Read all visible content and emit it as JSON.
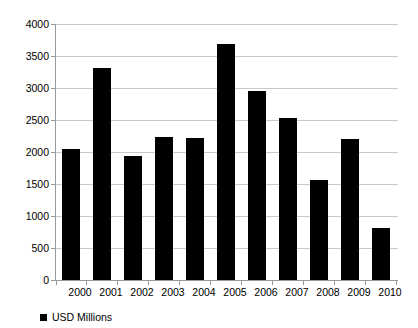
{
  "chart_data": {
    "type": "bar",
    "title": "",
    "subtitle": "",
    "xlabel": "",
    "ylabel": "",
    "categories": [
      "2000",
      "2001",
      "2002",
      "2003",
      "2004",
      "2005",
      "2006",
      "2007",
      "2008",
      "2009",
      "2010"
    ],
    "series": [
      {
        "name": "USD Millions",
        "color": "#000000",
        "values": [
          2050,
          3320,
          1940,
          2240,
          2220,
          3680,
          2950,
          2530,
          1560,
          2200,
          810
        ]
      }
    ],
    "values": [
      2050,
      3320,
      1940,
      2240,
      2220,
      3680,
      2950,
      2530,
      1560,
      2200,
      810
    ],
    "ylim": [
      0,
      4000
    ],
    "yticks": [
      0,
      500,
      1000,
      1500,
      2000,
      2500,
      3000,
      3500,
      4000
    ],
    "ytick_labels": [
      "0",
      "500",
      "1000",
      "1500",
      "2000",
      "2500",
      "3000",
      "3500",
      "4000"
    ],
    "grid": true,
    "grid_color": "#c9c9c9",
    "axis_color": "#9a9a9a",
    "background": "#ffffff",
    "legend": {
      "position": "bottom-left",
      "entries": [
        {
          "label": "USD Millions",
          "color": "#000000",
          "marker": "square-swatch"
        }
      ]
    }
  }
}
